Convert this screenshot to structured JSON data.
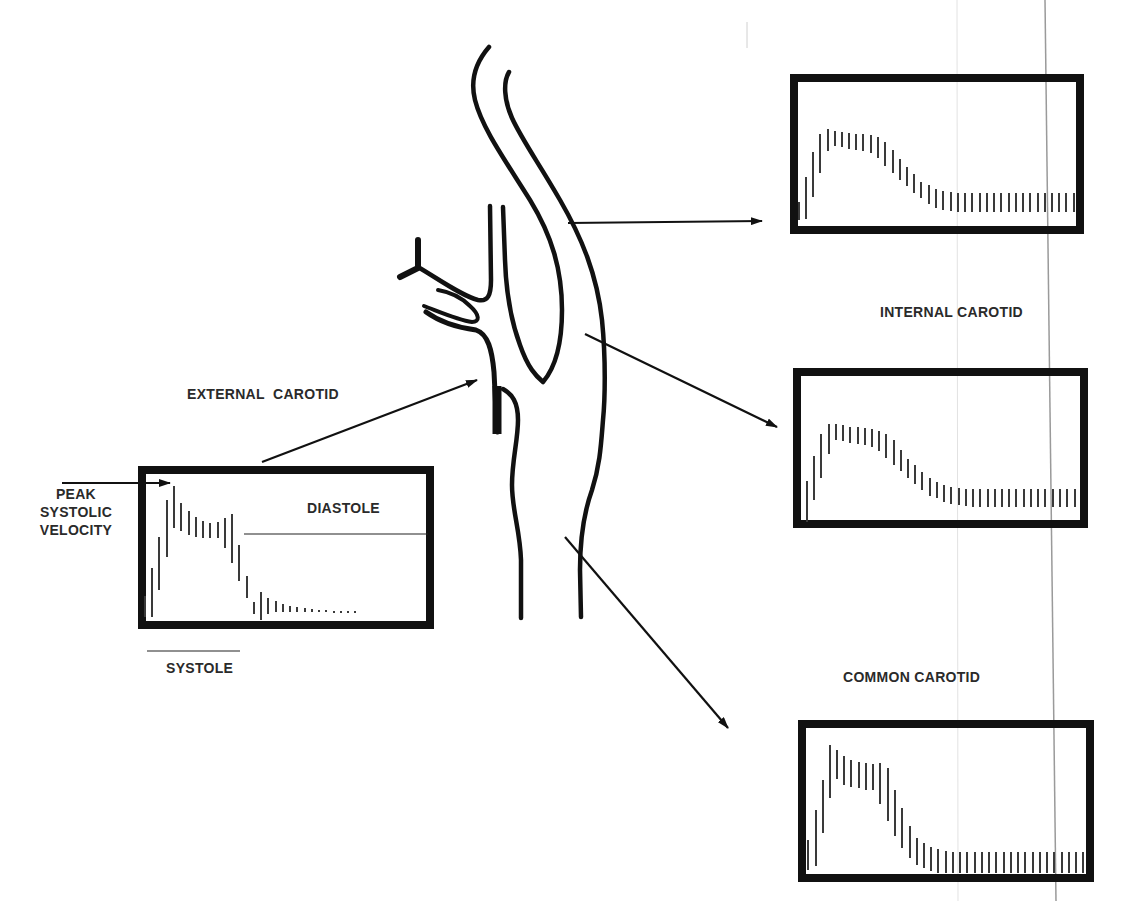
{
  "labels": {
    "external_carotid": "EXTERNAL  CAROTID",
    "internal_carotid": "INTERNAL CAROTID",
    "common_carotid": "COMMON CAROTID",
    "peak_line1": "PEAK",
    "peak_line2": "SYSTOLIC",
    "peak_line3": "VELOCITY",
    "diastole": "DIASTOLE",
    "systole": "SYSTOLE"
  },
  "colors": {
    "ink": "#111111",
    "bar": "#3a3a3a",
    "text": "#2a2a2a",
    "scan_line": "#9a9a9a",
    "background": "#ffffff"
  },
  "panels": [
    {
      "id": "external-carotid-waveform",
      "box": {
        "x": 138,
        "y": 466,
        "w": 296,
        "h": 163
      },
      "bars": [
        [
          145,
          596,
          617
        ],
        [
          152,
          568,
          617
        ],
        [
          159,
          537,
          590
        ],
        [
          167,
          500,
          557
        ],
        [
          174,
          486,
          528
        ],
        [
          181,
          503,
          531
        ],
        [
          189,
          511,
          535
        ],
        [
          196,
          517,
          537
        ],
        [
          203,
          521,
          538
        ],
        [
          210,
          523,
          538
        ],
        [
          218,
          522,
          538
        ],
        [
          225,
          518,
          548
        ],
        [
          232,
          514,
          563
        ],
        [
          239,
          545,
          581
        ],
        [
          247,
          576,
          598
        ],
        [
          254,
          602,
          614
        ],
        [
          261,
          592,
          620
        ],
        [
          268,
          598,
          614
        ],
        [
          276,
          601,
          612
        ],
        [
          283,
          604,
          612
        ],
        [
          290,
          606,
          612
        ],
        [
          297,
          607,
          612
        ],
        [
          305,
          608,
          612
        ],
        [
          312,
          609,
          612
        ],
        [
          319,
          610,
          612
        ],
        [
          326,
          610,
          612
        ],
        [
          334,
          611,
          613
        ],
        [
          341,
          611,
          613
        ],
        [
          348,
          611,
          613
        ],
        [
          355,
          611,
          613
        ]
      ]
    },
    {
      "id": "internal-carotid-waveform-top",
      "box": {
        "x": 790,
        "y": 74,
        "w": 294,
        "h": 160
      },
      "bars": [
        [
          799,
          202,
          220
        ],
        [
          806,
          177,
          219
        ],
        [
          813,
          152,
          197
        ],
        [
          820,
          134,
          173
        ],
        [
          828,
          129,
          151
        ],
        [
          835,
          131,
          146
        ],
        [
          842,
          132,
          147
        ],
        [
          849,
          133,
          149
        ],
        [
          856,
          134,
          150
        ],
        [
          863,
          134,
          151
        ],
        [
          871,
          135,
          153
        ],
        [
          878,
          137,
          158
        ],
        [
          885,
          142,
          166
        ],
        [
          893,
          150,
          173
        ],
        [
          900,
          159,
          180
        ],
        [
          907,
          167,
          186
        ],
        [
          914,
          174,
          193
        ],
        [
          921,
          182,
          198
        ],
        [
          929,
          185,
          204
        ],
        [
          936,
          189,
          208
        ],
        [
          943,
          191,
          210
        ],
        [
          951,
          192,
          211
        ],
        [
          958,
          193,
          212
        ],
        [
          965,
          193,
          212
        ],
        [
          972,
          193,
          212
        ],
        [
          980,
          193,
          212
        ],
        [
          987,
          193,
          212
        ],
        [
          994,
          193,
          212
        ],
        [
          1001,
          193,
          212
        ],
        [
          1009,
          193,
          212
        ],
        [
          1016,
          193,
          212
        ],
        [
          1023,
          193,
          212
        ],
        [
          1030,
          193,
          212
        ],
        [
          1038,
          193,
          212
        ],
        [
          1045,
          193,
          212
        ],
        [
          1052,
          193,
          212
        ],
        [
          1059,
          193,
          212
        ],
        [
          1066,
          193,
          212
        ],
        [
          1074,
          193,
          212
        ]
      ]
    },
    {
      "id": "internal-carotid-waveform-middle",
      "box": {
        "x": 793,
        "y": 368,
        "w": 295,
        "h": 160
      },
      "bars": [
        [
          807,
          481,
          522
        ],
        [
          814,
          456,
          500
        ],
        [
          821,
          434,
          478
        ],
        [
          829,
          424,
          454
        ],
        [
          836,
          424,
          440
        ],
        [
          843,
          425,
          441
        ],
        [
          850,
          427,
          443
        ],
        [
          858,
          427,
          444
        ],
        [
          865,
          428,
          445
        ],
        [
          872,
          429,
          447
        ],
        [
          879,
          431,
          451
        ],
        [
          886,
          434,
          458
        ],
        [
          894,
          440,
          465
        ],
        [
          901,
          450,
          471
        ],
        [
          908,
          459,
          478
        ],
        [
          915,
          465,
          484
        ],
        [
          922,
          472,
          490
        ],
        [
          930,
          478,
          496
        ],
        [
          937,
          482,
          498
        ],
        [
          944,
          485,
          502
        ],
        [
          951,
          487,
          504
        ],
        [
          959,
          488,
          505
        ],
        [
          966,
          489,
          506
        ],
        [
          973,
          489,
          507
        ],
        [
          980,
          489,
          507
        ],
        [
          988,
          489,
          507
        ],
        [
          995,
          489,
          507
        ],
        [
          1002,
          489,
          507
        ],
        [
          1009,
          489,
          507
        ],
        [
          1016,
          489,
          507
        ],
        [
          1024,
          489,
          507
        ],
        [
          1031,
          489,
          507
        ],
        [
          1038,
          489,
          507
        ],
        [
          1045,
          489,
          507
        ],
        [
          1053,
          489,
          507
        ],
        [
          1060,
          489,
          507
        ],
        [
          1067,
          489,
          507
        ],
        [
          1075,
          489,
          507
        ]
      ]
    },
    {
      "id": "common-carotid-waveform",
      "box": {
        "x": 798,
        "y": 720,
        "w": 296,
        "h": 162
      },
      "bars": [
        [
          808,
          840,
          870
        ],
        [
          816,
          810,
          866
        ],
        [
          823,
          780,
          833
        ],
        [
          830,
          745,
          798
        ],
        [
          837,
          750,
          779
        ],
        [
          844,
          756,
          785
        ],
        [
          851,
          760,
          787
        ],
        [
          859,
          762,
          788
        ],
        [
          866,
          763,
          790
        ],
        [
          873,
          764,
          790
        ],
        [
          880,
          763,
          804
        ],
        [
          888,
          768,
          821
        ],
        [
          895,
          790,
          836
        ],
        [
          902,
          808,
          848
        ],
        [
          910,
          826,
          858
        ],
        [
          917,
          838,
          865
        ],
        [
          924,
          843,
          868
        ],
        [
          931,
          847,
          871
        ],
        [
          938,
          849,
          873
        ],
        [
          946,
          851,
          873
        ],
        [
          953,
          852,
          873
        ],
        [
          960,
          852,
          873
        ],
        [
          967,
          852,
          873
        ],
        [
          975,
          852,
          873
        ],
        [
          982,
          852,
          873
        ],
        [
          989,
          852,
          873
        ],
        [
          996,
          852,
          873
        ],
        [
          1004,
          852,
          873
        ],
        [
          1011,
          852,
          873
        ],
        [
          1018,
          852,
          873
        ],
        [
          1025,
          852,
          873
        ],
        [
          1033,
          852,
          873
        ],
        [
          1040,
          852,
          873
        ],
        [
          1047,
          852,
          873
        ],
        [
          1054,
          852,
          873
        ],
        [
          1062,
          852,
          873
        ],
        [
          1069,
          852,
          873
        ],
        [
          1076,
          852,
          873
        ],
        [
          1083,
          852,
          873
        ]
      ]
    }
  ]
}
